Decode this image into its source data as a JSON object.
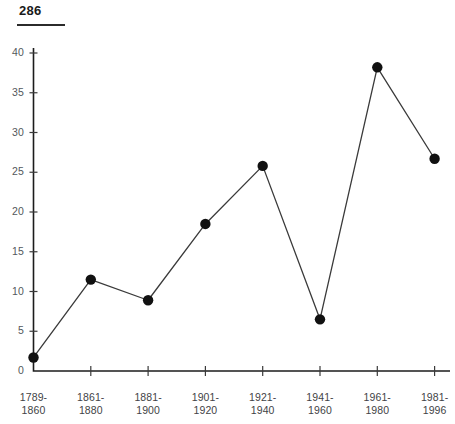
{
  "page": {
    "number": "286"
  },
  "chart_data": {
    "type": "line",
    "title": "",
    "subtitle": "",
    "xlabel": "",
    "ylabel": "",
    "categories": [
      "1789-1860",
      "1861-1880",
      "1881-1900",
      "1901-1920",
      "1921-1940",
      "1941-1960",
      "1961-1980",
      "1981-1996"
    ],
    "category_lines": [
      [
        "1789-",
        "1860"
      ],
      [
        "1861-",
        "1880"
      ],
      [
        "1881-",
        "1900"
      ],
      [
        "1901-",
        "1920"
      ],
      [
        "1921-",
        "1940"
      ],
      [
        "1941-",
        "1960"
      ],
      [
        "1961-",
        "1980"
      ],
      [
        "1981-",
        "1996"
      ]
    ],
    "values": [
      1.7,
      11.5,
      8.9,
      18.5,
      25.8,
      6.5,
      38.2,
      26.7
    ],
    "ylim": [
      0,
      40
    ],
    "ytick_step": 5,
    "yticks": [
      0,
      5,
      10,
      15,
      20,
      25,
      30,
      35,
      40
    ],
    "ytick_labels": [
      "0",
      "5",
      "10",
      "15",
      "20",
      "25",
      "30",
      "35",
      "40"
    ],
    "grid": false,
    "legend": null,
    "marker": "filled-circle",
    "line_color": "#3a3a3a",
    "marker_color": "#111111",
    "axis_color": "#1c1c1c",
    "background_color": "#ffffff"
  }
}
